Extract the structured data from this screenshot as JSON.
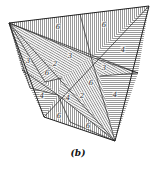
{
  "figure": {
    "caption": "(b)",
    "outline_color": "#222222",
    "hatch_color": "#555555",
    "vertices": {
      "top_left": [
        9,
        23
      ],
      "top_right": [
        149,
        6
      ],
      "bottom_right": [
        115,
        141
      ],
      "bottom_left": [
        44,
        117
      ],
      "center_upper": [
        91,
        57
      ],
      "center_lower": [
        58,
        95
      ]
    },
    "region_labels": [
      {
        "text": "6",
        "x": 58,
        "y": 29
      },
      {
        "text": "6",
        "x": 104,
        "y": 27
      },
      {
        "text": "4",
        "x": 123,
        "y": 52
      },
      {
        "text": "3",
        "x": 70,
        "y": 58
      },
      {
        "text": "2",
        "x": 55,
        "y": 66
      },
      {
        "text": "3",
        "x": 28,
        "y": 63
      },
      {
        "text": "6",
        "x": 47,
        "y": 75
      },
      {
        "text": "3",
        "x": 104,
        "y": 70
      },
      {
        "text": "6",
        "x": 91,
        "y": 85
      },
      {
        "text": "4",
        "x": 115,
        "y": 97
      },
      {
        "text": "4",
        "x": 42,
        "y": 98
      },
      {
        "text": "4",
        "x": 68,
        "y": 100
      },
      {
        "text": "2",
        "x": 82,
        "y": 98
      },
      {
        "text": "6",
        "x": 59,
        "y": 118
      },
      {
        "text": "6",
        "x": 88,
        "y": 128
      }
    ]
  }
}
